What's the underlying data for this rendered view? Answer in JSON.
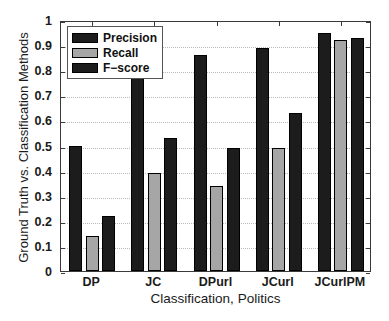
{
  "chart_data": {
    "type": "bar",
    "title": "",
    "subtitle": "",
    "xlabel": "Classification, Politics",
    "ylabel": "Ground Truth vs. Classification Methods",
    "categories": [
      "DP",
      "JC",
      "DPurl",
      "JCurl",
      "JCurlPM"
    ],
    "series": [
      {
        "name": "Precision",
        "color": "#1c1c1c",
        "values": [
          0.5,
          0.8,
          0.86,
          0.89,
          0.95
        ]
      },
      {
        "name": "Recall",
        "color": "#a6a6a6",
        "values": [
          0.14,
          0.39,
          0.34,
          0.49,
          0.92
        ]
      },
      {
        "name": "F-score",
        "color": "#1c1c1c",
        "values": [
          0.22,
          0.53,
          0.49,
          0.63,
          0.93
        ]
      }
    ],
    "ylim": [
      0,
      1
    ],
    "yticks": [
      0,
      0.1,
      0.2,
      0.3,
      0.4,
      0.5,
      0.6,
      0.7,
      0.8,
      0.9,
      1
    ],
    "ytick_labels": [
      "0",
      "0.1",
      "0.2",
      "0.3",
      "0.4",
      "0.5",
      "0.6",
      "0.7",
      "0.8",
      "0.9",
      "1"
    ],
    "grid": true,
    "grid_axis": "y",
    "legend_position": "top-left-inside",
    "legend_entries": [
      "Precision",
      "Recall",
      "F−score"
    ],
    "axis_color": "#3a3a3a",
    "grid_color": "#b9b9b9",
    "background": "#ffffff"
  }
}
